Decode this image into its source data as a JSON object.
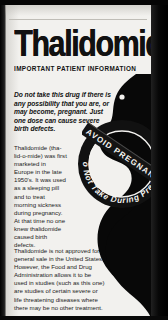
{
  "document": {
    "title": "Thalidomide",
    "subtitle": "IMPORTANT PATIENT INFORMATION",
    "warning": "Do not take this drug if there is any possibility that you are, or may become, pregnant. Just one dose can cause severe birth defects.",
    "body_paragraph_1": "Thalidomide (tha-lid-o-mide) was first marketed in Europe in the late 1950's. It was used as a sleeping pill and to treat morning sickness during pregnancy. At that time no one knew thalidomide caused birth defects.",
    "body_paragraph_2": "Thalidomide is not approved for general sale in the United States. However, the Food and Drug Administration allows it to be used in studies (such as this one) are studies of certain severe or life threatening diseases where there may be no other treatment."
  },
  "seal": {
    "banner_text": "AVOID PREGNANCY",
    "arc_text": "Do Not Take During Pregnancy"
  },
  "illustration": {
    "figure": "pregnant-woman-silhouette"
  },
  "colors": {
    "paper": "#f2f1ee",
    "ink": "#111111",
    "border": "#000000"
  }
}
